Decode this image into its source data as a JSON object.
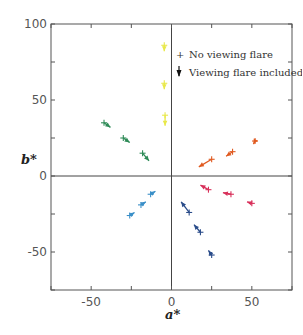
{
  "chart_data": {
    "type": "scatter",
    "title": "",
    "xlabel": "a*",
    "ylabel": "b*",
    "xlim": [
      -75,
      75
    ],
    "ylim": [
      -75,
      100
    ],
    "xticks": [
      -75,
      -50,
      -25,
      0,
      25,
      50,
      75
    ],
    "yticks": [
      -75,
      -50,
      -25,
      0,
      25,
      50,
      75,
      100
    ],
    "xtick_labels": [
      {
        "value": -50,
        "label": "-50"
      },
      {
        "value": 0,
        "label": "0"
      },
      {
        "value": 50,
        "label": "50"
      }
    ],
    "ytick_labels": [
      {
        "value": -50,
        "label": "-50"
      },
      {
        "value": 0,
        "label": "0"
      },
      {
        "value": 50,
        "label": "50"
      },
      {
        "value": 100,
        "label": "100"
      }
    ],
    "grid": false,
    "zero_lines": true,
    "legend": {
      "position": "upper-right",
      "entries": [
        {
          "symbol": "+",
          "label": "No viewing flare"
        },
        {
          "symbol": "arrow",
          "label": "Viewing flare included"
        }
      ]
    },
    "series": [
      {
        "name": "yellow",
        "color": "#e8e84a",
        "points": [
          {
            "no_flare": [
              -4.5,
              86
            ],
            "flare": [
              -4.5,
              82
            ]
          },
          {
            "no_flare": [
              -4.5,
              61
            ],
            "flare": [
              -4.5,
              57
            ]
          },
          {
            "no_flare": [
              -4,
              40
            ],
            "flare": [
              -4,
              33
            ]
          }
        ]
      },
      {
        "name": "green",
        "color": "#2e8b57",
        "points": [
          {
            "no_flare": [
              -42,
              35
            ],
            "flare": [
              -38,
              32
            ]
          },
          {
            "no_flare": [
              -30,
              25
            ],
            "flare": [
              -26,
              22
            ]
          },
          {
            "no_flare": [
              -18,
              15
            ],
            "flare": [
              -14,
              10
            ]
          }
        ]
      },
      {
        "name": "orange",
        "color": "#e05a20",
        "points": [
          {
            "no_flare": [
              25,
              11
            ],
            "flare": [
              17,
              6
            ]
          },
          {
            "no_flare": [
              38,
              16
            ],
            "flare": [
              34,
              13
            ]
          },
          {
            "no_flare": [
              52,
              23
            ],
            "flare": [
              51,
              21
            ]
          }
        ]
      },
      {
        "name": "red",
        "color": "#d8305a",
        "points": [
          {
            "no_flare": [
              23,
              -9
            ],
            "flare": [
              18,
              -6
            ]
          },
          {
            "no_flare": [
              37,
              -12
            ],
            "flare": [
              32,
              -11
            ]
          },
          {
            "no_flare": [
              50,
              -18
            ],
            "flare": [
              47,
              -17
            ]
          }
        ]
      },
      {
        "name": "light-blue",
        "color": "#3a8fc8",
        "points": [
          {
            "no_flare": [
              -13,
              -12
            ],
            "flare": [
              -10,
              -10
            ]
          },
          {
            "no_flare": [
              -19,
              -19
            ],
            "flare": [
              -16,
              -17
            ]
          },
          {
            "no_flare": [
              -26,
              -26
            ],
            "flare": [
              -23,
              -24
            ]
          }
        ]
      },
      {
        "name": "navy-blue",
        "color": "#2a4c8a",
        "points": [
          {
            "no_flare": [
              11,
              -24
            ],
            "flare": [
              6,
              -17
            ]
          },
          {
            "no_flare": [
              18,
              -37
            ],
            "flare": [
              14,
              -32
            ]
          },
          {
            "no_flare": [
              25,
              -52
            ],
            "flare": [
              23,
              -49
            ]
          }
        ]
      }
    ]
  }
}
